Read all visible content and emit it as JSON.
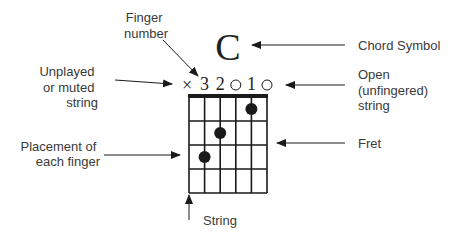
{
  "chord": {
    "symbol": "C",
    "string_markers": [
      "×",
      "3",
      "2",
      "○",
      "1",
      "○"
    ],
    "marker_types": [
      "muted",
      "finger",
      "finger",
      "open",
      "finger",
      "open"
    ],
    "num_strings": 6,
    "num_frets": 4,
    "fingered_positions": [
      {
        "string": 2,
        "fret": 3,
        "finger": 3
      },
      {
        "string": 3,
        "fret": 2,
        "finger": 2
      },
      {
        "string": 5,
        "fret": 1,
        "finger": 1
      }
    ]
  },
  "labels": {
    "finger_number": [
      "Finger",
      "number"
    ],
    "chord_symbol": "Chord Symbol",
    "unplayed": [
      "Unplayed",
      "or muted",
      "string"
    ],
    "open_string": [
      "Open",
      "(unfingered)",
      "string"
    ],
    "fret": "Fret",
    "placement": [
      "Placement of",
      "each finger"
    ],
    "string": "String"
  },
  "colors": {
    "ink": "#1a1a1a",
    "label": "#3a3a3a",
    "background": "#ffffff"
  }
}
